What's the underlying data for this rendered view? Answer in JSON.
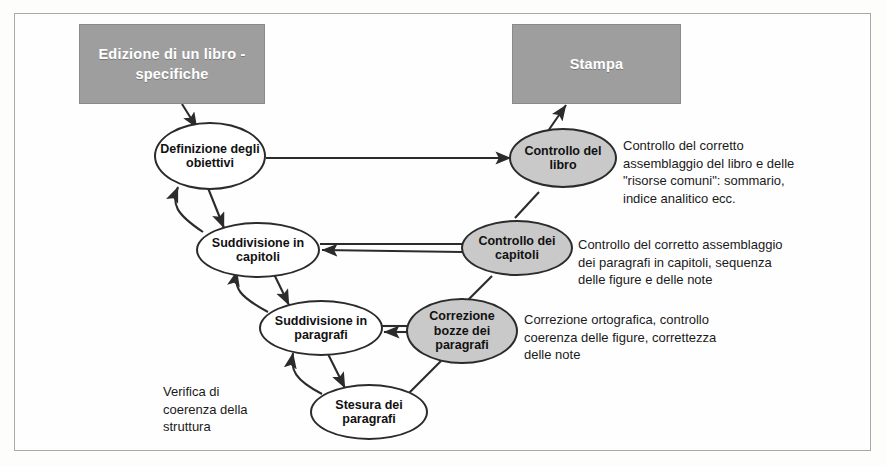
{
  "diagram": {
    "boxes": [
      {
        "id": "start",
        "label": "Edizione di un\nlibro - specifiche"
      },
      {
        "id": "end",
        "label": "Stampa"
      }
    ],
    "nodes": [
      {
        "id": "obiettivi",
        "label": "Definizione\ndegli\nobiettivi",
        "fill": "white"
      },
      {
        "id": "capitoli",
        "label": "Suddivisione\nin capitoli",
        "fill": "white"
      },
      {
        "id": "paragrafi",
        "label": "Suddivisione\nin paragrafi",
        "fill": "white"
      },
      {
        "id": "stesura",
        "label": "Stesura dei\nparagrafi",
        "fill": "white"
      },
      {
        "id": "correzione",
        "label": "Correzione\nbozze dei\nparagrafi",
        "fill": "gray"
      },
      {
        "id": "ctrl-capitoli",
        "label": "Controllo\ndei capitoli",
        "fill": "gray"
      },
      {
        "id": "ctrl-libro",
        "label": "Controllo\ndel libro",
        "fill": "gray"
      }
    ],
    "notes": [
      {
        "id": "note-libro",
        "text": "Controllo del corretto\nassemblaggio del libro e delle\n\"risorse comuni\": sommario,\nindice analitico ecc."
      },
      {
        "id": "note-capitoli",
        "text": "Controllo del corretto assemblaggio\ndei paragrafi in capitoli, sequenza\ndelle figure e delle note"
      },
      {
        "id": "note-correzione",
        "text": "Correzione ortografica, controllo\ncoerenza delle figure, correttezza\ndelle note"
      },
      {
        "id": "note-verifica",
        "text": "Verifica di\ncoerenza della\nstruttura"
      }
    ],
    "colors": {
      "box_fill": "#9e9e9e",
      "node_fill_gray": "#c9c9c9",
      "node_fill_white": "#ffffff",
      "stroke": "#2b2b2b",
      "frame": "#a9a9a9"
    }
  }
}
